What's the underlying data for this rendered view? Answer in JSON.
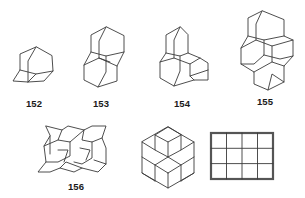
{
  "figure": {
    "compounds": [
      {
        "id": "152",
        "label": "152",
        "name": "adamantane-structure"
      },
      {
        "id": "153",
        "label": "153",
        "name": "diamantane-structure"
      },
      {
        "id": "154",
        "label": "154",
        "name": "triamantane-structure"
      },
      {
        "id": "155",
        "label": "155",
        "name": "tetramantane-structure"
      },
      {
        "id": "156",
        "label": "156",
        "name": "higher-diamondoid-structure"
      }
    ],
    "lattices": [
      {
        "name": "hexagonal-rhombus-lattice"
      },
      {
        "name": "square-grid-lattice",
        "rows": 3,
        "cols": 4
      }
    ],
    "colors": {
      "line": "#3a3a3a",
      "label": "#1a1a1a",
      "thick_line": "#555555"
    }
  }
}
